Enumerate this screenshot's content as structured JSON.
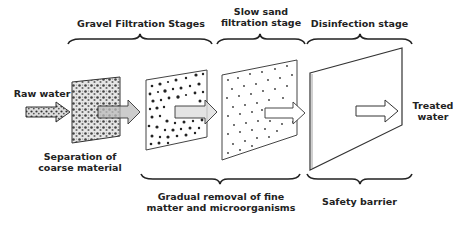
{
  "diagram": {
    "type": "process-flow",
    "direction": "left-to-right",
    "input": {
      "label": "Raw water"
    },
    "output": {
      "label_line1": "Treated",
      "label_line2": "water"
    },
    "top_groups": [
      {
        "label": "Gravel Filtration Stages"
      },
      {
        "label_line1": "Slow sand",
        "label_line2": "filtration stage"
      },
      {
        "label": "Disinfection stage"
      }
    ],
    "bottom_groups": [
      {
        "label_line1": "Separation of",
        "label_line2": "coarse material"
      },
      {
        "label_line1": "Gradual removal of fine",
        "label_line2": "matter and microorganisms"
      },
      {
        "label": "Safety barrier"
      }
    ],
    "panels": [
      {
        "name": "coarse-gravel-filter",
        "texture": "dense-gravel"
      },
      {
        "name": "fine-gravel-filter",
        "texture": "medium-particles"
      },
      {
        "name": "slow-sand-filter",
        "texture": "sparse-dots"
      },
      {
        "name": "disinfection-barrier",
        "texture": "blank"
      }
    ],
    "colors": {
      "stroke": "#222222",
      "background": "#ffffff"
    }
  }
}
